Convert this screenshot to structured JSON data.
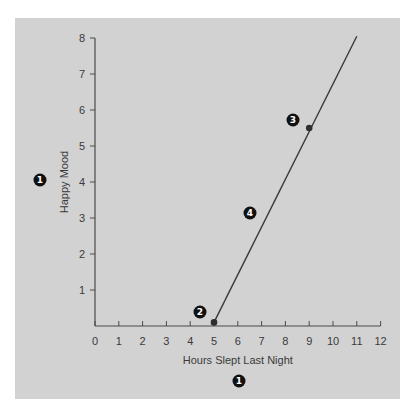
{
  "chart_data": {
    "type": "line",
    "title": "",
    "xlabel": "Hours Slept Last Night",
    "ylabel": "Happy Mood",
    "xlim": [
      0,
      12
    ],
    "ylim": [
      0,
      8
    ],
    "x_ticks": [
      "0",
      "1",
      "2",
      "3",
      "4",
      "5",
      "6",
      "7",
      "8",
      "9",
      "10",
      "11",
      "12"
    ],
    "y_ticks": [
      "1",
      "2",
      "3",
      "4",
      "5",
      "6",
      "7",
      "8"
    ],
    "grid": false,
    "legend": null,
    "series": [
      {
        "name": "Happy Mood vs Hours Slept",
        "x": [
          5,
          11
        ],
        "y": [
          0.1,
          8.05
        ]
      }
    ],
    "points": [
      {
        "x": 5,
        "y": 0.1
      },
      {
        "x": 9,
        "y": 5.5
      }
    ],
    "annotations": [
      {
        "label": "1",
        "target": "y-axis label"
      },
      {
        "label": "1",
        "target": "x-axis label"
      },
      {
        "label": "2",
        "target": "point (5, 0.1)"
      },
      {
        "label": "3",
        "target": "point (9, 5.5)"
      },
      {
        "label": "4",
        "target": "line"
      }
    ]
  },
  "markers": {
    "m1": "1",
    "m2": "2",
    "m3": "3",
    "m4": "4"
  }
}
